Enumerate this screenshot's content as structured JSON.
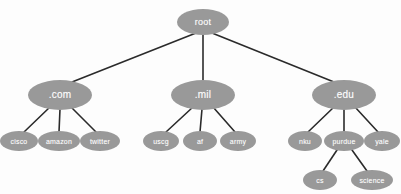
{
  "diagram": {
    "type": "tree",
    "canvas": {
      "width": 401,
      "height": 194
    },
    "style": {
      "node_fill": "#999999",
      "node_text_color": "#ffffff",
      "edge_color": "#2b2b2b",
      "background": "#fdfdfd"
    },
    "nodes": [
      {
        "id": "root",
        "label": "root",
        "level": 0,
        "x": 203,
        "y": 22,
        "rx": 26,
        "ry": 13,
        "font_size": 9
      },
      {
        "id": "com",
        "label": ".com",
        "level": 1,
        "x": 60,
        "y": 95,
        "rx": 32,
        "ry": 15,
        "font_size": 10
      },
      {
        "id": "mil",
        "label": ".mil",
        "level": 1,
        "x": 203,
        "y": 95,
        "rx": 32,
        "ry": 15,
        "font_size": 10
      },
      {
        "id": "edu",
        "label": ".edu",
        "level": 1,
        "x": 344,
        "y": 95,
        "rx": 32,
        "ry": 15,
        "font_size": 10
      },
      {
        "id": "cisco",
        "label": "cisco",
        "level": 2,
        "x": 19,
        "y": 141,
        "rx": 19,
        "ry": 10,
        "font_size": 7
      },
      {
        "id": "amazon",
        "label": "amazon",
        "level": 2,
        "x": 59,
        "y": 141,
        "rx": 21,
        "ry": 10,
        "font_size": 7
      },
      {
        "id": "twitter",
        "label": "twitter",
        "level": 2,
        "x": 100,
        "y": 141,
        "rx": 20,
        "ry": 10,
        "font_size": 7
      },
      {
        "id": "uscg",
        "label": "uscg",
        "level": 2,
        "x": 161,
        "y": 141,
        "rx": 18,
        "ry": 10,
        "font_size": 7
      },
      {
        "id": "af",
        "label": "af",
        "level": 2,
        "x": 200,
        "y": 141,
        "rx": 17,
        "ry": 10,
        "font_size": 7
      },
      {
        "id": "army",
        "label": "army",
        "level": 2,
        "x": 238,
        "y": 141,
        "rx": 18,
        "ry": 10,
        "font_size": 7
      },
      {
        "id": "nku",
        "label": "nku",
        "level": 2,
        "x": 305,
        "y": 141,
        "rx": 17,
        "ry": 10,
        "font_size": 7
      },
      {
        "id": "purdue",
        "label": "purdue",
        "level": 2,
        "x": 344,
        "y": 141,
        "rx": 20,
        "ry": 10,
        "font_size": 7
      },
      {
        "id": "yale",
        "label": "yale",
        "level": 2,
        "x": 382,
        "y": 141,
        "rx": 18,
        "ry": 10,
        "font_size": 7
      },
      {
        "id": "cs",
        "label": "cs",
        "level": 3,
        "x": 320,
        "y": 180,
        "rx": 17,
        "ry": 10,
        "font_size": 7
      },
      {
        "id": "science",
        "label": "science",
        "level": 3,
        "x": 372,
        "y": 180,
        "rx": 21,
        "ry": 10,
        "font_size": 7
      }
    ],
    "edges": [
      {
        "from": "root",
        "to": "com",
        "x1": 196,
        "y1": 33,
        "x2": 72,
        "y2": 82
      },
      {
        "from": "root",
        "to": "mil",
        "x1": 203,
        "y1": 34,
        "x2": 203,
        "y2": 81
      },
      {
        "from": "root",
        "to": "edu",
        "x1": 212,
        "y1": 33,
        "x2": 334,
        "y2": 82
      },
      {
        "from": "com",
        "to": "cisco",
        "x1": 50,
        "y1": 107,
        "x2": 24,
        "y2": 132
      },
      {
        "from": "com",
        "to": "amazon",
        "x1": 60,
        "y1": 109,
        "x2": 59,
        "y2": 132
      },
      {
        "from": "com",
        "to": "twitter",
        "x1": 71,
        "y1": 107,
        "x2": 96,
        "y2": 132
      },
      {
        "from": "mil",
        "to": "uscg",
        "x1": 193,
        "y1": 107,
        "x2": 166,
        "y2": 132
      },
      {
        "from": "mil",
        "to": "af",
        "x1": 202,
        "y1": 109,
        "x2": 200,
        "y2": 132
      },
      {
        "from": "mil",
        "to": "army",
        "x1": 213,
        "y1": 107,
        "x2": 235,
        "y2": 132
      },
      {
        "from": "edu",
        "to": "nku",
        "x1": 334,
        "y1": 107,
        "x2": 308,
        "y2": 132
      },
      {
        "from": "edu",
        "to": "purdue",
        "x1": 344,
        "y1": 109,
        "x2": 344,
        "y2": 132
      },
      {
        "from": "edu",
        "to": "yale",
        "x1": 355,
        "y1": 107,
        "x2": 378,
        "y2": 132
      },
      {
        "from": "purdue",
        "to": "cs",
        "x1": 337,
        "y1": 150,
        "x2": 323,
        "y2": 171
      },
      {
        "from": "purdue",
        "to": "science",
        "x1": 352,
        "y1": 150,
        "x2": 367,
        "y2": 171
      }
    ]
  }
}
